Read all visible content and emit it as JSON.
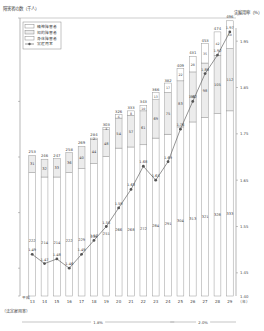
{
  "chart_data": {
    "type": "bar",
    "subtype": "stacked bar + line (dual axis)",
    "title": "",
    "ylabel_left": "障害者の数（千人）",
    "ylabel_right": "実雇用率（%）",
    "xlabel": "平成（年）",
    "left_ylim": [
      0,
      500
    ],
    "left_ticks": [
      0,
      50,
      100,
      150,
      200,
      250,
      300,
      350,
      400,
      450,
      500
    ],
    "right_ylim": [
      1.4,
      2.0
    ],
    "right_ticks": [
      1.4,
      1.45,
      1.5,
      1.55,
      1.6,
      1.65,
      1.7,
      1.75,
      1.8,
      1.85,
      1.9,
      1.95,
      2.0
    ],
    "categories": [
      "13",
      "14",
      "15",
      "16",
      "17",
      "18",
      "19",
      "20",
      "21",
      "22",
      "23",
      "24",
      "25",
      "26",
      "27",
      "28",
      "29"
    ],
    "x_prefix": "平成",
    "x_suffix": "（年）",
    "series": [
      {
        "name": "身体障害者",
        "type": "bar",
        "color": "#ffffff",
        "values": [
          222,
          214,
          214,
          222,
          229,
          238,
          251,
          266,
          268,
          272,
          284,
          291,
          304,
          313,
          321,
          328,
          333
        ]
      },
      {
        "name": "知的障害者",
        "type": "bar",
        "color": "#eeeeee",
        "values": [
          31,
          32,
          33,
          36,
          40,
          44,
          48,
          54,
          57,
          61,
          69,
          75,
          83,
          90,
          98,
          105,
          112
        ]
      },
      {
        "name": "精神障害者",
        "type": "bar",
        "color": "#ffffff",
        "values": [
          0,
          0,
          0,
          0,
          0,
          2,
          4,
          6,
          8,
          10,
          13,
          17,
          22,
          28,
          35,
          42,
          50
        ]
      },
      {
        "name": "実雇用率",
        "type": "line",
        "axis": "right",
        "color": "#555555",
        "values": [
          1.49,
          1.47,
          1.48,
          1.46,
          1.49,
          1.52,
          1.55,
          1.59,
          1.63,
          1.68,
          1.65,
          1.69,
          1.76,
          1.82,
          1.88,
          1.92,
          1.97
        ]
      }
    ],
    "totals": [
      253,
      246,
      247,
      258,
      269,
      284,
      303,
      326,
      333,
      343,
      366,
      382,
      409,
      431,
      453,
      474,
      496
    ],
    "legend": [
      "精神障害者",
      "知的障害者",
      "身体障害者",
      "実雇用率"
    ],
    "legend_position": "top-left",
    "annotations": {
      "legal_rate_label": "（法定雇用率）",
      "legal_rates": [
        {
          "label": "1.8%",
          "from": "13",
          "to": "24"
        },
        {
          "label": "2.0%",
          "from": "25",
          "to": "29"
        }
      ]
    },
    "grid": false
  }
}
